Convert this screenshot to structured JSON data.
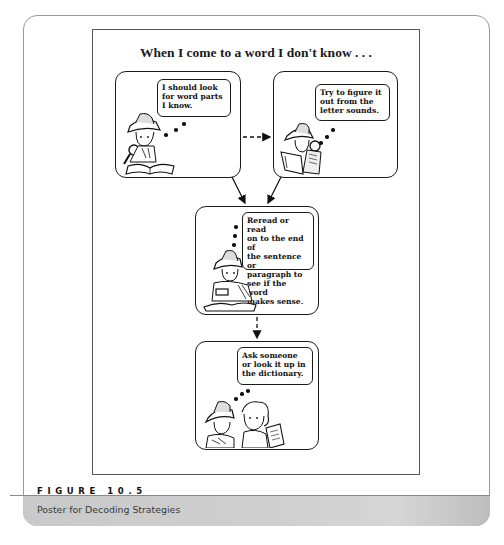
{
  "poster": {
    "title": "When I come to a word I don't know . . .",
    "panels": [
      {
        "id": "word-parts",
        "thought": "I should look\nfor word parts\nI know.",
        "illustration": "detective-with-magnifier-reading-book"
      },
      {
        "id": "letter-sounds",
        "thought": "Try to figure it\nout from the\nletter sounds.",
        "illustration": "detective-reading-book"
      },
      {
        "id": "reread",
        "thought": "Reread  or read\non to the end of\nthe sentence or\nparagraph to\nsee if the word\nmakes sense.",
        "illustration": "detective-with-magnifier-over-book"
      },
      {
        "id": "ask-someone",
        "thought": "Ask someone\nor look it up in\nthe dictionary.",
        "illustration": "detective-talking-with-girl-holding-book"
      }
    ],
    "connectors": [
      {
        "from": "word-parts",
        "to": "letter-sounds",
        "style": "dashed"
      },
      {
        "from": "word-parts",
        "to": "reread",
        "style": "solid"
      },
      {
        "from": "letter-sounds",
        "to": "reread",
        "style": "solid"
      },
      {
        "from": "reread",
        "to": "ask-someone",
        "style": "dashed"
      }
    ]
  },
  "caption": {
    "figure_label": "FIGURE 10.5",
    "text": "Poster for Decoding Strategies"
  }
}
